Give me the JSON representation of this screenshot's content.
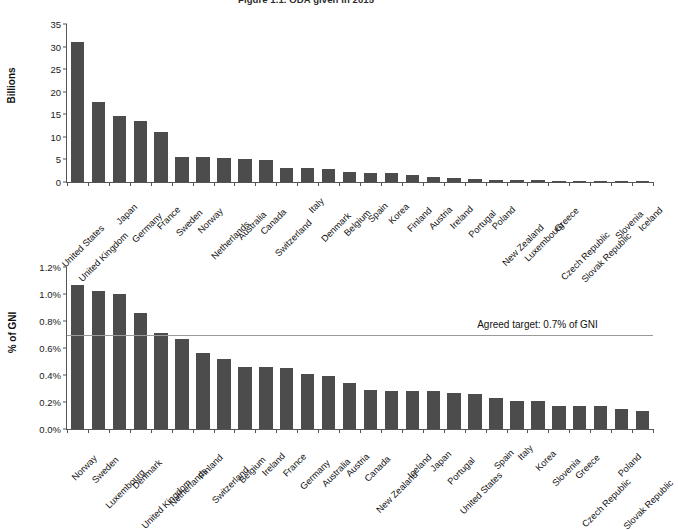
{
  "figure": {
    "title": "Figure 1.1. ODA given in 2015"
  },
  "chart_data": [
    {
      "type": "bar",
      "id": "oda-billions",
      "title": "",
      "xlabel": "",
      "ylabel": "Billions",
      "ylim": [
        0,
        35
      ],
      "yticks": [
        0,
        5,
        10,
        15,
        20,
        25,
        30,
        35
      ],
      "ytick_labels": [
        "0",
        "5",
        "10",
        "15",
        "20",
        "25",
        "30",
        "35"
      ],
      "grid": false,
      "legend": "none",
      "bar_color": "#4c4c4c",
      "categories": [
        "United States",
        "United Kingdom",
        "Japan",
        "Germany",
        "France",
        "Sweden",
        "Norway",
        "Netherlands",
        "Australia",
        "Canada",
        "Switzerland",
        "Italy",
        "Denmark",
        "Belgium",
        "Spain",
        "Korea",
        "Finland",
        "Austria",
        "Ireland",
        "Portugal",
        "Poland",
        "New Zealand",
        "Luxembourg",
        "Greece",
        "Czech Republic",
        "Slovak Republic",
        "Slovenia",
        "Iceland"
      ],
      "values": [
        31.1,
        17.8,
        14.6,
        13.5,
        11.0,
        5.6,
        5.5,
        5.4,
        5.2,
        4.9,
        3.2,
        3.0,
        2.8,
        2.3,
        1.9,
        1.9,
        1.6,
        1.2,
        0.8,
        0.6,
        0.45,
        0.44,
        0.36,
        0.28,
        0.21,
        0.09,
        0.06,
        0.04
      ]
    },
    {
      "type": "bar",
      "id": "oda-pct-gni",
      "title": "",
      "xlabel": "",
      "ylabel": "% of GNI",
      "ylim": [
        0,
        1.2
      ],
      "yticks": [
        0.0,
        0.2,
        0.4,
        0.6,
        0.8,
        1.0,
        1.2
      ],
      "ytick_labels": [
        "0.0%",
        "0.2%",
        "0.4%",
        "0.6%",
        "0.8%",
        "1.0%",
        "1.2%"
      ],
      "grid": false,
      "legend": "none",
      "bar_color": "#4c4c4c",
      "annotations": [
        {
          "kind": "hline",
          "value": 0.7,
          "label": "Agreed target: 0.7% of GNI",
          "color": "#9a9a9a"
        }
      ],
      "categories": [
        "Norway",
        "Sweden",
        "Luxembourg",
        "Denmark",
        "United Kingdom",
        "Netherlands",
        "Finland",
        "Switzerland",
        "Belgium",
        "Ireland",
        "France",
        "Germany",
        "Australia",
        "Austria",
        "Canada",
        "New Zealand",
        "Iceland",
        "Japan",
        "Portugal",
        "United States",
        "Spain",
        "Italy",
        "Korea",
        "Slovenia",
        "Greece",
        "Czech Republic",
        "Poland",
        "Slovak Republic"
      ],
      "values": [
        1.07,
        1.02,
        1.0,
        0.86,
        0.71,
        0.67,
        0.56,
        0.52,
        0.46,
        0.46,
        0.45,
        0.41,
        0.39,
        0.34,
        0.29,
        0.28,
        0.28,
        0.28,
        0.27,
        0.26,
        0.23,
        0.21,
        0.21,
        0.17,
        0.17,
        0.17,
        0.15,
        0.13
      ]
    }
  ]
}
